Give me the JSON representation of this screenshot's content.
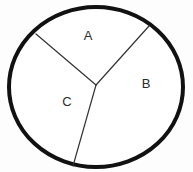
{
  "figure": {
    "background_color": "#fdfdfd",
    "stroke_color": "#111111",
    "label_color": "#2b2b2b"
  },
  "chart_data": {
    "type": "pie",
    "title": "",
    "xlabel": "",
    "ylabel": "",
    "legend_position": "none",
    "grid": false,
    "labels": [
      "A",
      "B",
      "C"
    ],
    "values": [
      25,
      36,
      39
    ],
    "units": "percent",
    "center": {
      "x": 96,
      "y": 85
    },
    "radii": {
      "rx": 88,
      "ry": 81
    },
    "circle_center": {
      "x": 96,
      "y": 87
    },
    "slices": [
      {
        "label": "A",
        "value": 25,
        "start_angle_deg": 228,
        "end_angle_deg": 312,
        "label_position": {
          "x": 88,
          "y": 37
        },
        "boundary_points": [
          {
            "x": 36,
            "y": 34
          },
          {
            "x": 149,
            "y": 26
          }
        ]
      },
      {
        "label": "B",
        "value": 36,
        "start_angle_deg": 312,
        "end_angle_deg": 74,
        "label_position": {
          "x": 146,
          "y": 85
        },
        "boundary_points": [
          {
            "x": 149,
            "y": 26
          },
          {
            "x": 73,
            "y": 166
          }
        ]
      },
      {
        "label": "C",
        "value": 39,
        "start_angle_deg": 74,
        "end_angle_deg": 228,
        "label_position": {
          "x": 67,
          "y": 103
        },
        "boundary_points": [
          {
            "x": 73,
            "y": 166
          },
          {
            "x": 36,
            "y": 34
          }
        ]
      }
    ],
    "radius_lines": [
      {
        "name": "divider-a-c",
        "from": {
          "x": 96,
          "y": 85
        },
        "to": {
          "x": 36,
          "y": 34
        }
      },
      {
        "name": "divider-a-b",
        "from": {
          "x": 96,
          "y": 85
        },
        "to": {
          "x": 149,
          "y": 26
        }
      },
      {
        "name": "divider-b-c",
        "from": {
          "x": 96,
          "y": 85
        },
        "to": {
          "x": 73,
          "y": 166
        }
      }
    ]
  },
  "labels": {
    "a": "A",
    "b": "B",
    "c": "C"
  }
}
